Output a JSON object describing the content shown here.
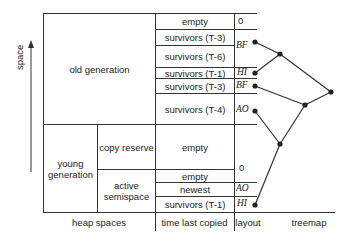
{
  "axis": {
    "label": "space"
  },
  "heap_spaces": {
    "old": "old generation",
    "young": "young generation",
    "copy_reserve": "copy reserve",
    "active_semispace": "active semispace"
  },
  "rows": [
    {
      "label": "empty",
      "layout": "0"
    },
    {
      "label": "survivors (T-3)",
      "layout": "BF"
    },
    {
      "label": "survivors (T-6)",
      "layout": ""
    },
    {
      "label": "survivors (T-1)",
      "layout": "HI"
    },
    {
      "label": "survivors (T-3)",
      "layout": "BF"
    },
    {
      "label": "survivors (T-4)",
      "layout": "AO"
    },
    {
      "label": "empty",
      "layout": "0"
    },
    {
      "label": "empty",
      "layout": ""
    },
    {
      "label": "newest",
      "layout": "AO"
    },
    {
      "label": "survivors (T-1)",
      "layout": "HI"
    }
  ],
  "footer": {
    "heap_spaces": "heap spaces",
    "time": "time last copied",
    "layout": "layout",
    "treemap": "treemap"
  }
}
